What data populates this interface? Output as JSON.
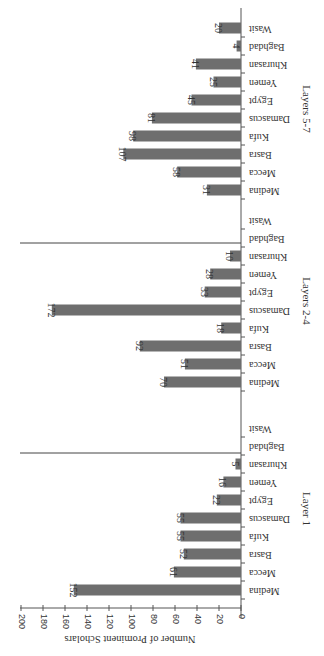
{
  "chart_data": {
    "type": "bar",
    "orientation": "rotated (page rotated 90°, bars horizontal in view)",
    "ylabel": "Number of Prominent Scholars",
    "xlabel": "",
    "ylim": [
      0,
      200
    ],
    "yticks": [
      0,
      20,
      40,
      60,
      80,
      100,
      120,
      140,
      160,
      180,
      200
    ],
    "grid": false,
    "categories": [
      "Medina",
      "Mecca",
      "Basra",
      "Kufa",
      "Damascus",
      "Egypt",
      "Yemen",
      "Khurasan",
      "Baghdad",
      "Wasit"
    ],
    "groups": [
      {
        "name": "Layer 1",
        "values": [
          152,
          61,
          52,
          55,
          55,
          22,
          16,
          5,
          0,
          0
        ],
        "labels": [
          "152",
          "61",
          "52",
          "55",
          "55",
          "22",
          "16",
          "5",
          "",
          ""
        ]
      },
      {
        "name": "Layers 2-4",
        "values": [
          70,
          51,
          92,
          18,
          172,
          33,
          28,
          10,
          0,
          0
        ],
        "labels": [
          "70",
          "51",
          "92",
          "18",
          "172",
          "33",
          "28",
          "10",
          "",
          ""
        ]
      },
      {
        "name": "Layers 5-7",
        "values": [
          31,
          58,
          107,
          98,
          81,
          45,
          25,
          41,
          4,
          20
        ],
        "labels": [
          "31",
          "58",
          "107",
          "98",
          "81",
          "45",
          "25",
          "41",
          "4",
          "20"
        ]
      }
    ]
  },
  "colors": {
    "bar": "#6e6e6e",
    "axis": "#555555",
    "text": "#333333"
  }
}
